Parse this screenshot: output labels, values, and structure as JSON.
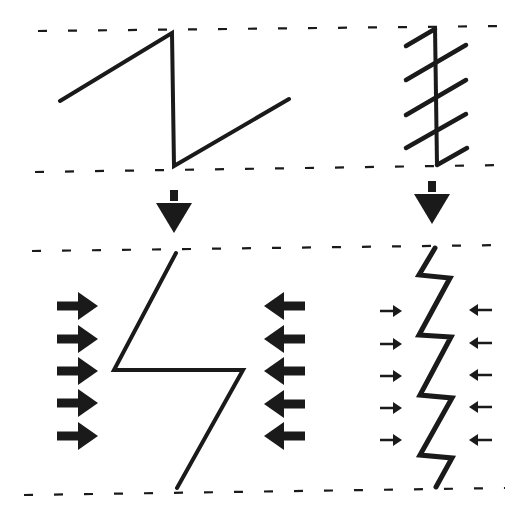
{
  "canvas": {
    "width": 519,
    "height": 518,
    "background": "#ffffff",
    "ink": "#1a1a1a"
  },
  "dashed_lines": [
    {
      "name": "top-boundary-upper",
      "x1": 38,
      "y1": 31,
      "x2": 505,
      "y2": 26
    },
    {
      "name": "top-boundary-lower",
      "x1": 35,
      "y1": 172,
      "x2": 505,
      "y2": 165
    },
    {
      "name": "bottom-boundary-upper",
      "x1": 32,
      "y1": 251,
      "x2": 505,
      "y2": 245
    },
    {
      "name": "bottom-boundary-lower",
      "x1": 24,
      "y1": 495,
      "x2": 505,
      "y2": 488
    }
  ],
  "shapes": {
    "sawtooth_wide": [
      [
        60,
        101
      ],
      [
        172,
        33
      ],
      [
        174,
        166
      ],
      [
        289,
        99
      ]
    ],
    "sawtooth_vertical_spine": [
      [
        435,
        27
      ],
      [
        437,
        165
      ]
    ],
    "sawtooth_hatches": [
      [
        [
          406,
          46
        ],
        [
          435,
          29
        ]
      ],
      [
        [
          406,
          80
        ],
        [
          466,
          45
        ]
      ],
      [
        [
          406,
          115
        ],
        [
          466,
          80
        ]
      ],
      [
        [
          406,
          148
        ],
        [
          466,
          114
        ]
      ],
      [
        [
          437,
          165
        ],
        [
          467,
          148
        ]
      ]
    ],
    "zigzag_wide": [
      [
        176,
        253
      ],
      [
        114,
        370
      ],
      [
        243,
        370
      ],
      [
        177,
        488
      ]
    ],
    "zigzag_narrow": [
      [
        435,
        248
      ],
      [
        419,
        275
      ],
      [
        450,
        278
      ],
      [
        419,
        335
      ],
      [
        451,
        337
      ],
      [
        420,
        395
      ],
      [
        452,
        398
      ],
      [
        420,
        455
      ],
      [
        452,
        458
      ],
      [
        436,
        487
      ]
    ]
  },
  "down_arrows": [
    {
      "name": "down-arrow-left",
      "cx": 174,
      "top": 190,
      "tip": 233
    },
    {
      "name": "down-arrow-right",
      "cx": 432,
      "top": 181,
      "tip": 224
    }
  ],
  "force_arrows": {
    "left_large": {
      "direction": "right",
      "x_start": 57,
      "x_tip": 98,
      "ys": [
        306,
        339,
        371,
        403,
        436
      ],
      "size": "large"
    },
    "right_large": {
      "direction": "left",
      "x_start": 305,
      "x_tip": 264,
      "ys": [
        306,
        339,
        371,
        404,
        436
      ],
      "size": "large"
    },
    "left_small": {
      "direction": "right",
      "x_start": 380,
      "x_tip": 402,
      "ys": [
        311,
        344,
        376,
        408,
        440
      ],
      "size": "small"
    },
    "right_small": {
      "direction": "left",
      "x_start": 492,
      "x_tip": 469,
      "ys": [
        310,
        343,
        375,
        407,
        440
      ],
      "size": "small"
    }
  }
}
